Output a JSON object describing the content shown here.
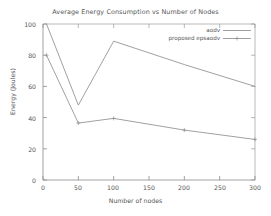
{
  "chart_data": {
    "type": "line",
    "title": "Average Energy Consumption vs Number of Nodes",
    "xlabel": "Number of nodes",
    "ylabel": "Energy (Joules)",
    "xlim": [
      0,
      300
    ],
    "ylim": [
      0,
      100
    ],
    "xticks": [
      0,
      50,
      100,
      150,
      200,
      250,
      300
    ],
    "yticks": [
      0,
      20,
      40,
      60,
      80,
      100
    ],
    "xtick_labels": [
      "0",
      "50",
      "100",
      "150",
      "200",
      "250",
      "300"
    ],
    "ytick_labels": [
      "0",
      "20",
      "40",
      "60",
      "80",
      "100"
    ],
    "grid": false,
    "legend_position": "top-right",
    "series": [
      {
        "name": "aodv",
        "color": "#8f8f8f",
        "marker": "none",
        "x": [
          5,
          50,
          100,
          200,
          300
        ],
        "values": [
          100,
          48,
          89,
          74,
          60
        ]
      },
      {
        "name": "proposed epsaodv",
        "color": "#8f8f8f",
        "marker": "plus",
        "x": [
          5,
          50,
          100,
          200,
          300
        ],
        "values": [
          80,
          36.5,
          39.5,
          32,
          26
        ]
      }
    ]
  },
  "legend": {
    "entries": [
      {
        "label": "aodv"
      },
      {
        "label": "proposed epsaodv"
      }
    ]
  },
  "axes": {
    "y_tick_0": "0",
    "y_tick_1": "20",
    "y_tick_2": "40",
    "y_tick_3": "60",
    "y_tick_4": "80",
    "y_tick_5": "100",
    "x_tick_0": "0",
    "x_tick_1": "50",
    "x_tick_2": "100",
    "x_tick_3": "150",
    "x_tick_4": "200",
    "x_tick_5": "250",
    "x_tick_6": "300"
  }
}
